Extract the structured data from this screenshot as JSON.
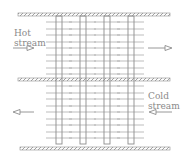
{
  "diagram": {
    "hot_stream": {
      "label_line1": "Hot",
      "label_line2": "stream",
      "direction": "right"
    },
    "cold_stream": {
      "label_line1": "Cold",
      "label_line2": "stream",
      "direction": "left"
    },
    "tube_count": 4,
    "colors": {
      "line": "#9a9a9a",
      "wall": "#8c8c8c",
      "text": "#8a8a8a",
      "background": "#ffffff"
    },
    "icons": [
      "arrow-right-icon",
      "arrow-left-icon"
    ]
  }
}
